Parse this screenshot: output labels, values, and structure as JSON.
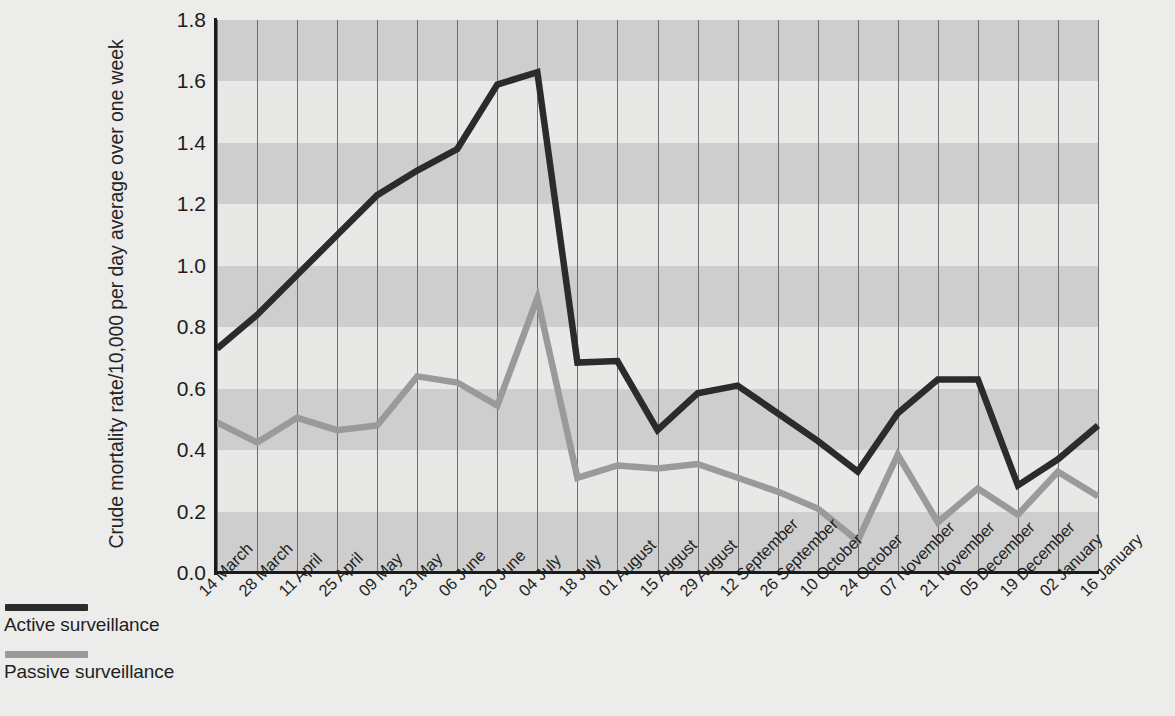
{
  "chart_data": {
    "type": "line",
    "title": "",
    "xlabel": "",
    "ylabel": "Crude mortality rate/10,000 per day average over one week",
    "ylim": [
      0.0,
      1.8
    ],
    "ytick_labels": [
      "0.0",
      "0.2",
      "0.4",
      "0.6",
      "0.8",
      "1.0",
      "1.2",
      "1.4",
      "1.6",
      "1.8"
    ],
    "ytick_values": [
      0.0,
      0.2,
      0.4,
      0.6,
      0.8,
      1.0,
      1.2,
      1.4,
      1.6,
      1.8
    ],
    "grid": "vertical gridlines at each category; alternating horizontal shaded bands every 0.2",
    "legend_position": "below-left",
    "categories": [
      "14 March",
      "28 March",
      "11 April",
      "25 April",
      "09 May",
      "23 May",
      "06 June",
      "20 June",
      "04 July",
      "18 July",
      "01 August",
      "15 August",
      "29 August",
      "12 September",
      "26 September",
      "10 October",
      "24 October",
      "07 November",
      "21 November",
      "05 December",
      "19 December",
      "02 January",
      "16 January"
    ],
    "series": [
      {
        "name": "Active surveillance",
        "color": "#2b2b2b",
        "values": [
          0.73,
          0.84,
          0.97,
          1.1,
          1.23,
          1.31,
          1.38,
          1.59,
          1.63,
          0.685,
          0.69,
          0.465,
          0.585,
          0.61,
          0.52,
          0.43,
          0.33,
          0.52,
          0.63,
          0.63,
          0.285,
          0.37,
          0.48
        ]
      },
      {
        "name": "Passive surveillance",
        "color": "#9a9a9a",
        "values": [
          0.49,
          0.425,
          0.505,
          0.465,
          0.48,
          0.64,
          0.62,
          0.545,
          0.895,
          0.31,
          0.35,
          0.34,
          0.355,
          0.31,
          0.265,
          0.21,
          0.105,
          0.385,
          0.165,
          0.275,
          0.19,
          0.33,
          0.25
        ]
      }
    ]
  },
  "legend": {
    "items": [
      {
        "label": "Active surveillance",
        "color": "#2b2b2b"
      },
      {
        "label": "Passive surveillance",
        "color": "#9a9a9a"
      }
    ]
  },
  "style": {
    "band_light": "#e8e8e7",
    "band_dark": "#cecece",
    "gridline": "#6e6e6e",
    "axis": "#1a1a1a",
    "page_background": "#ececeb"
  }
}
